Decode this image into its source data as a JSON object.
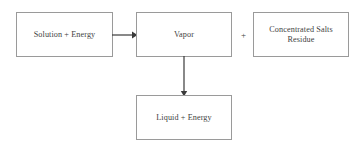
{
  "diagram": {
    "background_color": "#ffffff",
    "border_color": "#9a9a9a",
    "line_color": "#3a3a3a",
    "text_color": "#3f3f3f",
    "nodes": [
      {
        "id": "solution",
        "label": "Solution + Energy",
        "shape": "rectangle"
      },
      {
        "id": "vapor",
        "label": "Vapor",
        "shape": "rectangle"
      },
      {
        "id": "residue",
        "label": "Concentrated Salts\nResidue",
        "shape": "rectangle"
      },
      {
        "id": "liquid",
        "label": "Liquid + Energy",
        "shape": "rectangle"
      }
    ],
    "operators": [
      {
        "id": "plus",
        "symbol": "+",
        "between": [
          "vapor",
          "residue"
        ]
      }
    ],
    "connectors": [
      {
        "id": "solution-to-vapor",
        "from": "solution",
        "to": "vapor",
        "direction": "right",
        "arrowhead": "filled-triangle"
      },
      {
        "id": "vapor-to-liquid",
        "from": "vapor",
        "to": "liquid",
        "direction": "down",
        "arrowhead": "filled-triangle"
      }
    ]
  }
}
